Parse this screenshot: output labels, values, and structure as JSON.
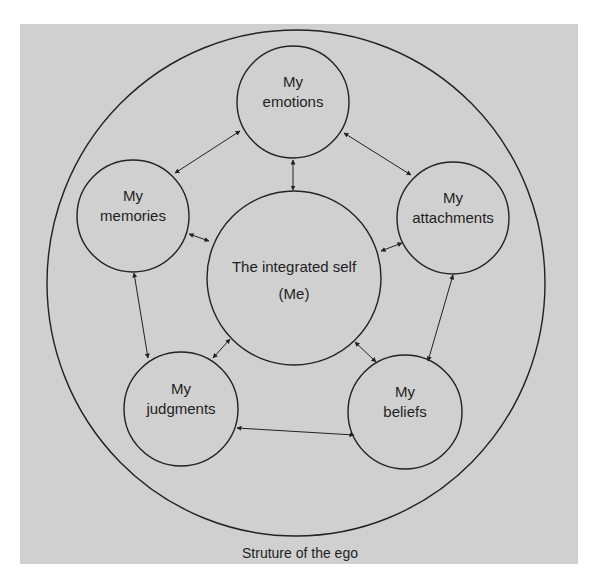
{
  "diagram": {
    "caption": "Struture of the ego",
    "colors": {
      "background": "#d0d0d0",
      "stroke": "#222222",
      "text": "#1e1e1e"
    },
    "outer": {
      "cx": 296,
      "cy": 283,
      "rx": 249,
      "ry": 253
    },
    "center": {
      "id": "self",
      "cx": 294,
      "cy": 278,
      "r": 87,
      "line1": "The integrated self",
      "line2": "(Me)"
    },
    "nodes": [
      {
        "id": "emotions",
        "cx": 293,
        "cy": 102,
        "r": 56,
        "line1": "My",
        "line2": "emotions"
      },
      {
        "id": "memories",
        "cx": 133,
        "cy": 216,
        "r": 56,
        "line1": "My",
        "line2": "memories"
      },
      {
        "id": "attachments",
        "cx": 453,
        "cy": 218,
        "r": 56,
        "line1": "My",
        "line2": "attachments"
      },
      {
        "id": "judgments",
        "cx": 181,
        "cy": 409,
        "r": 57,
        "line1": "My",
        "line2": "judgments"
      },
      {
        "id": "beliefs",
        "cx": 405,
        "cy": 412,
        "r": 57,
        "line1": "My",
        "line2": "beliefs"
      }
    ],
    "edges": [
      {
        "from": "memories",
        "to": "emotions",
        "x1": 175,
        "y1": 173,
        "x2": 240,
        "y2": 131,
        "start_arrow": true,
        "end_arrow": true
      },
      {
        "from": "emotions",
        "to": "attachments",
        "x1": 344,
        "y1": 133,
        "x2": 411,
        "y2": 175,
        "start_arrow": true,
        "end_arrow": true
      },
      {
        "from": "emotions",
        "to": "self",
        "x1": 293,
        "y1": 160,
        "x2": 293,
        "y2": 190,
        "start_arrow": true,
        "end_arrow": true
      },
      {
        "from": "memories",
        "to": "self",
        "x1": 189,
        "y1": 234,
        "x2": 209,
        "y2": 241,
        "start_arrow": true,
        "end_arrow": true
      },
      {
        "from": "attachments",
        "to": "self",
        "x1": 402,
        "y1": 243,
        "x2": 381,
        "y2": 251,
        "start_arrow": true,
        "end_arrow": true
      },
      {
        "from": "memories",
        "to": "judgments",
        "x1": 134,
        "y1": 273,
        "x2": 148,
        "y2": 358,
        "start_arrow": true,
        "end_arrow": true
      },
      {
        "from": "self",
        "to": "judgments",
        "x1": 230,
        "y1": 339,
        "x2": 213,
        "y2": 358,
        "start_arrow": true,
        "end_arrow": true
      },
      {
        "from": "self",
        "to": "beliefs",
        "x1": 355,
        "y1": 342,
        "x2": 376,
        "y2": 362,
        "start_arrow": true,
        "end_arrow": true
      },
      {
        "from": "attachments",
        "to": "beliefs",
        "x1": 453,
        "y1": 275,
        "x2": 428,
        "y2": 361,
        "start_arrow": true,
        "end_arrow": true
      },
      {
        "from": "judgments",
        "to": "beliefs",
        "x1": 237,
        "y1": 428,
        "x2": 354,
        "y2": 435,
        "start_arrow": true,
        "end_arrow": true
      }
    ]
  }
}
